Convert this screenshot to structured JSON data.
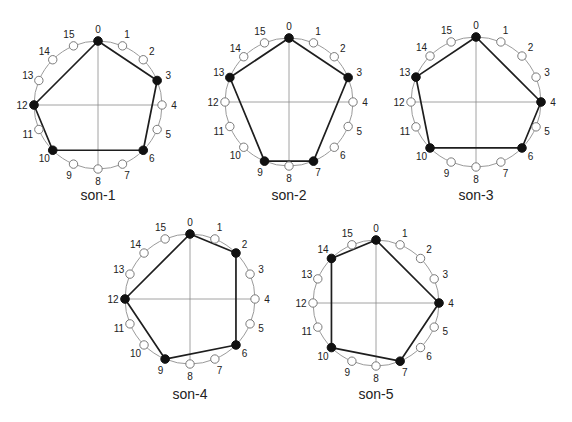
{
  "figure": {
    "node_count": 16,
    "node_labels": [
      "0",
      "1",
      "2",
      "3",
      "4",
      "5",
      "6",
      "7",
      "8",
      "9",
      "10",
      "11",
      "12",
      "13",
      "14",
      "15"
    ],
    "colors": {
      "ring": "#9a9a9a",
      "axis": "#8a8a8a",
      "edge": "#1e1e1e",
      "filled_node": "#111111",
      "open_node_fill": "#ffffff",
      "open_node_stroke": "#7a7a7a",
      "text": "#222222"
    },
    "diagrams": [
      {
        "caption": "son-1",
        "cx": 98,
        "cy": 105,
        "r": 64,
        "caption_y": 200,
        "active_nodes": [
          0,
          3,
          6,
          10,
          12
        ]
      },
      {
        "caption": "son-2",
        "cx": 289,
        "cy": 102,
        "r": 64,
        "caption_y": 200,
        "active_nodes": [
          0,
          3,
          7,
          9,
          13
        ]
      },
      {
        "caption": "son-3",
        "cx": 476,
        "cy": 102,
        "r": 65,
        "caption_y": 200,
        "active_nodes": [
          0,
          4,
          6,
          10,
          13
        ]
      },
      {
        "caption": "son-4",
        "cx": 190,
        "cy": 299,
        "r": 65,
        "caption_y": 399,
        "active_nodes": [
          0,
          2,
          6,
          9,
          12
        ]
      },
      {
        "caption": "son-5",
        "cx": 376,
        "cy": 303,
        "r": 63,
        "caption_y": 399,
        "active_nodes": [
          0,
          4,
          7,
          10,
          14
        ]
      }
    ]
  }
}
